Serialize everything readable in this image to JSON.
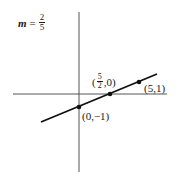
{
  "slope": {
    "variable": "m",
    "equals": "=",
    "numerator": "2",
    "denominator": "5"
  },
  "points": [
    {
      "label": "(0,−1)",
      "x": 0,
      "y": -1
    },
    {
      "label_open": "(",
      "label_num": "5",
      "label_den": "2",
      "label_close": ",0)",
      "x": 2.5,
      "y": 0
    },
    {
      "label": "(5,1)",
      "x": 5,
      "y": 1
    }
  ],
  "line": {
    "slope": 0.4,
    "y_intercept": -1,
    "color": "#111111"
  },
  "axes": {
    "color": "#555555"
  }
}
